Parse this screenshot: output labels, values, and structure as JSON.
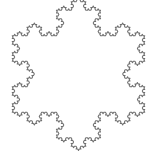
{
  "figure": {
    "title": "Koch Snowflake",
    "alt_text": "Koch snowflake fractal curve outline",
    "shape_name": "koch-snowflake",
    "orientation": "point-up",
    "canvas_width": 157,
    "canvas_height": 164,
    "background_color": "#ffffff",
    "stroke_color": "#707070",
    "fill_color": "none",
    "stroke_width": 1.05,
    "iteration_order": 4,
    "sides": 3,
    "total_segments": 192,
    "clipped_edges": "top",
    "geometry": {
      "center_x": 78.5,
      "center_y": 74.0,
      "circumradius": 76.5,
      "bounding_box": {
        "left": 10,
        "top": -2,
        "right": 147,
        "bottom": 150
      },
      "vertices": [
        {
          "name": "top-apex",
          "x": 78.5,
          "y": -2.5
        },
        {
          "name": "lower-right",
          "x": 144.75,
          "y": 112.25
        },
        {
          "name": "lower-left",
          "x": 12.25,
          "y": 112.25
        }
      ]
    }
  }
}
